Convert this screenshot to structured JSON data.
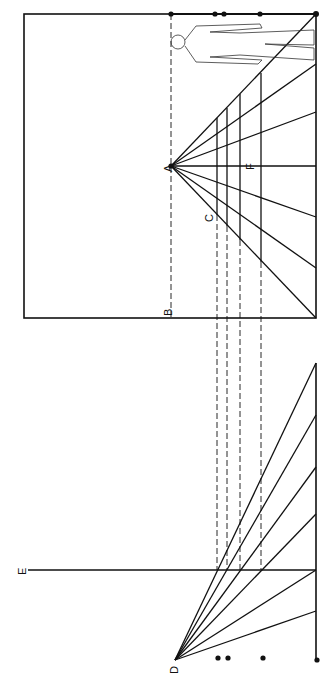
{
  "diagram": {
    "labels": {
      "A": "A",
      "B": "B",
      "C": "C",
      "D": "D",
      "E": "E",
      "F": "F"
    },
    "colors": {
      "ink": "#111111",
      "background": "#ffffff"
    },
    "picture_plane": {
      "x1": 24,
      "y1": 14,
      "x2": 316,
      "y2": 318
    },
    "vanishing_point_A": [
      171,
      166
    ],
    "station_point_D": [
      175,
      660
    ],
    "horizon_line_E_y": 570,
    "transfer_lines_x": [
      217,
      227,
      240,
      261
    ],
    "dots_top": [
      171,
      215,
      224,
      260,
      316
    ],
    "dots_bottom": [
      218,
      228,
      263,
      317
    ]
  }
}
